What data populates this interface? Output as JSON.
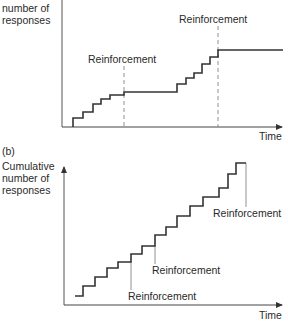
{
  "chart_data": [
    {
      "id": "a",
      "type": "line",
      "subtype": "step",
      "title": "",
      "panel_label": "",
      "ylabel": "number of responses",
      "xlabel": "Time",
      "grid": false,
      "legend": null,
      "description": "Cumulative record under a fixed-interval schedule: bursts of responding before reinforcement, flat pause after.",
      "steps": [
        {
          "x": 73,
          "y": 127
        },
        {
          "x": 73,
          "y": 118
        },
        {
          "x": 83,
          "y": 118
        },
        {
          "x": 83,
          "y": 112
        },
        {
          "x": 93,
          "y": 112
        },
        {
          "x": 93,
          "y": 104
        },
        {
          "x": 101,
          "y": 104
        },
        {
          "x": 101,
          "y": 99
        },
        {
          "x": 110,
          "y": 99
        },
        {
          "x": 110,
          "y": 95
        },
        {
          "x": 124,
          "y": 95
        },
        {
          "x": 124,
          "y": 92
        },
        {
          "x": 177,
          "y": 92
        },
        {
          "x": 177,
          "y": 84
        },
        {
          "x": 186,
          "y": 84
        },
        {
          "x": 186,
          "y": 78
        },
        {
          "x": 194,
          "y": 78
        },
        {
          "x": 194,
          "y": 73
        },
        {
          "x": 202,
          "y": 73
        },
        {
          "x": 202,
          "y": 64
        },
        {
          "x": 210,
          "y": 64
        },
        {
          "x": 210,
          "y": 57
        },
        {
          "x": 218,
          "y": 57
        },
        {
          "x": 218,
          "y": 50
        },
        {
          "x": 283,
          "y": 50
        }
      ],
      "annotations": [
        {
          "text": "Reinforcement",
          "x_line": 124,
          "style": "dashed",
          "label_x": 88,
          "label_y": 53
        },
        {
          "text": "Reinforcement",
          "x_line": 218,
          "style": "dashed",
          "label_x": 179,
          "label_y": 13
        }
      ]
    },
    {
      "id": "b",
      "type": "line",
      "subtype": "step",
      "title": "",
      "panel_label": "(b)",
      "ylabel": "Cumulative number of responses",
      "xlabel": "Time",
      "grid": false,
      "legend": null,
      "description": "Cumulative record under a variable/ratio schedule: steady staircase of responding with reinforcements along the way.",
      "steps": [
        {
          "x": 75,
          "y": 296
        },
        {
          "x": 83,
          "y": 296
        },
        {
          "x": 83,
          "y": 286
        },
        {
          "x": 95,
          "y": 286
        },
        {
          "x": 95,
          "y": 277
        },
        {
          "x": 107,
          "y": 277
        },
        {
          "x": 107,
          "y": 268
        },
        {
          "x": 118,
          "y": 268
        },
        {
          "x": 118,
          "y": 262
        },
        {
          "x": 131,
          "y": 262
        },
        {
          "x": 131,
          "y": 254
        },
        {
          "x": 142,
          "y": 254
        },
        {
          "x": 142,
          "y": 246
        },
        {
          "x": 155,
          "y": 246
        },
        {
          "x": 155,
          "y": 235
        },
        {
          "x": 166,
          "y": 235
        },
        {
          "x": 166,
          "y": 227
        },
        {
          "x": 177,
          "y": 227
        },
        {
          "x": 177,
          "y": 216
        },
        {
          "x": 190,
          "y": 216
        },
        {
          "x": 190,
          "y": 206
        },
        {
          "x": 203,
          "y": 206
        },
        {
          "x": 203,
          "y": 197
        },
        {
          "x": 219,
          "y": 197
        },
        {
          "x": 219,
          "y": 188
        },
        {
          "x": 228,
          "y": 188
        },
        {
          "x": 228,
          "y": 174
        },
        {
          "x": 236,
          "y": 174
        },
        {
          "x": 236,
          "y": 163
        },
        {
          "x": 246,
          "y": 163
        }
      ],
      "annotations": [
        {
          "text": "Reinforcement",
          "x_line": 131,
          "y_from": 262,
          "y_to": 290,
          "style": "solid",
          "label_x": 128,
          "label_y": 290
        },
        {
          "text": "Reinforcement",
          "x_line": 155,
          "y_from": 246,
          "y_to": 264,
          "style": "solid",
          "label_x": 152,
          "label_y": 264
        },
        {
          "text": "Reinforcement",
          "x_line": 246,
          "y_from": 163,
          "y_to": 207,
          "style": "solid",
          "label_x": 213,
          "label_y": 207
        }
      ]
    }
  ],
  "labels": {
    "a_ylabel_line1": "number of",
    "a_ylabel_line2": "responses",
    "a_xlabel": "Time",
    "a_reinf_1": "Reinforcement",
    "a_reinf_2": "Reinforcement",
    "b_panel": "(b)",
    "b_ylabel_line1": "Cumulative",
    "b_ylabel_line2": "number of",
    "b_ylabel_line3": "responses",
    "b_xlabel": "Time",
    "b_reinf_1": "Reinforcement",
    "b_reinf_2": "Reinforcement",
    "b_reinf_3": "Reinforcement"
  },
  "colors": {
    "line": "#333333",
    "guide": "#777777",
    "background": "#ffffff"
  }
}
